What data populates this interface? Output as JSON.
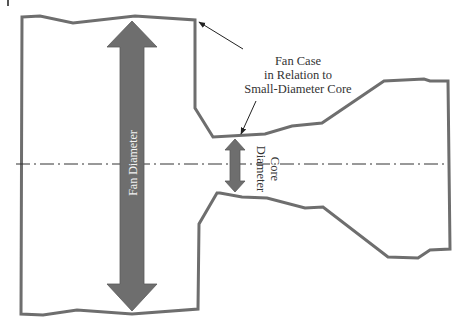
{
  "figure": {
    "type": "engine-cross-section-schematic",
    "colors": {
      "outline": "#6e6e6e",
      "arrow_fill": "#6e6e6e",
      "centerline": "#333333",
      "background": "#ffffff",
      "fan_label_text": "#f2f2f2",
      "label_text": "#333333"
    },
    "labels": {
      "annotation_line1": "Fan Case",
      "annotation_line2": "in Relation to",
      "annotation_line3": "Small-Diameter Core",
      "fan_diameter": "Fan Diameter",
      "core_line1": "Core",
      "core_line2": "Diameter"
    }
  }
}
